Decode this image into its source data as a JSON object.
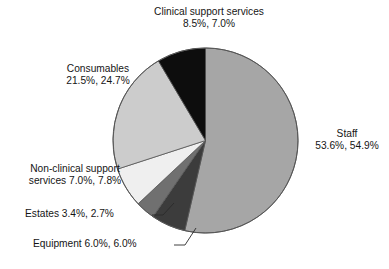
{
  "chart_data": {
    "type": "pie",
    "title": "",
    "subtitle": "",
    "xlabel": "",
    "ylabel": "",
    "grid": false,
    "legend_position": "none",
    "note": "Each slice is annotated with two percentage series; slice geometry follows the first series.",
    "categories": [
      "Staff",
      "Equipment",
      "Estates",
      "Non-clinical support services",
      "Consumables",
      "Clinical support services"
    ],
    "series": [
      {
        "name": "Series 1",
        "values": [
          53.6,
          6.0,
          3.4,
          7.0,
          21.5,
          8.5
        ]
      },
      {
        "name": "Series 2",
        "values": [
          54.9,
          6.0,
          2.7,
          7.8,
          24.7,
          7.0
        ]
      }
    ],
    "slices": [
      {
        "label": "Staff",
        "value": 53.6,
        "value2": 54.9,
        "color": "#a6a6a6",
        "start_deg": 0.0,
        "end_deg": 192.96
      },
      {
        "label": "Equipment",
        "value": 6.0,
        "value2": 6.0,
        "color": "#3c3c3c",
        "start_deg": 192.96,
        "end_deg": 214.56
      },
      {
        "label": "Estates",
        "value": 3.4,
        "value2": 2.7,
        "color": "#707070",
        "start_deg": 214.56,
        "end_deg": 226.8
      },
      {
        "label": "Non-clinical support services",
        "value": 7.0,
        "value2": 7.8,
        "color": "#efefef",
        "start_deg": 226.8,
        "end_deg": 252.0
      },
      {
        "label": "Consumables",
        "value": 21.5,
        "value2": 24.7,
        "color": "#cccccc",
        "start_deg": 252.0,
        "end_deg": 329.4
      },
      {
        "label": "Clinical support services",
        "value": 8.5,
        "value2": 7.0,
        "color": "#0d0d0d",
        "start_deg": 329.4,
        "end_deg": 360.0
      }
    ]
  },
  "labels": {
    "clinical": {
      "line1": "Clinical support services",
      "line2": "8.5%, 7.0%"
    },
    "consumables": {
      "line1": "Consumables",
      "line2": "21.5%, 24.7%"
    },
    "staff": {
      "line1": "Staff",
      "line2": "53.6%, 54.9%"
    },
    "nonclinical": {
      "line1": "Non-clinical support",
      "line2": "services  7.0%, 7.8%"
    },
    "estates": {
      "line1": "Estates 3.4%, 2.7%"
    },
    "equipment": {
      "line1": "Equipment 6.0%, 6.0%"
    }
  },
  "colors": {
    "staff": "#a6a6a6",
    "equipment": "#3c3c3c",
    "estates": "#707070",
    "nonclinical": "#efefef",
    "consumables": "#cccccc",
    "clinical": "#0d0d0d",
    "outline": "#555555",
    "background": "#ffffff",
    "text": "#151515"
  }
}
